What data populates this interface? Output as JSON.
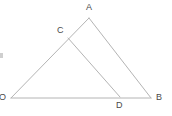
{
  "figure": {
    "background_color": "#ffffff",
    "line_color": "#b4b4b4",
    "line_width": 1,
    "label_color": "#4a4a4a",
    "label_font_size": 9,
    "points": [
      {
        "id": "O",
        "label": "O",
        "x": 11,
        "y": 98,
        "label_x": -1,
        "label_y": 93
      },
      {
        "id": "A",
        "label": "A",
        "x": 89,
        "y": 18,
        "label_x": 86,
        "label_y": 3
      },
      {
        "id": "B",
        "label": "B",
        "x": 151,
        "y": 98,
        "label_x": 156,
        "label_y": 93
      },
      {
        "id": "C",
        "label": "C",
        "x": 68,
        "y": 38,
        "label_x": 57,
        "label_y": 26
      },
      {
        "id": "D",
        "label": "D",
        "x": 120,
        "y": 97,
        "label_x": 116,
        "label_y": 101
      }
    ],
    "segments": [
      {
        "id": "OA",
        "from": "O",
        "to": "A",
        "description": "left side of triangle through C"
      },
      {
        "id": "AB",
        "from": "A",
        "to": "B",
        "description": "right side of triangle"
      },
      {
        "id": "OB",
        "from": "O",
        "to": "B",
        "description": "base of triangle through D"
      },
      {
        "id": "CD",
        "from": "C",
        "to": "D",
        "description": "cevian from C to D"
      }
    ],
    "artifact": {
      "present": true,
      "x": 0,
      "y": 53,
      "width": 3,
      "height": 5,
      "color": "#cfcfcf"
    }
  }
}
